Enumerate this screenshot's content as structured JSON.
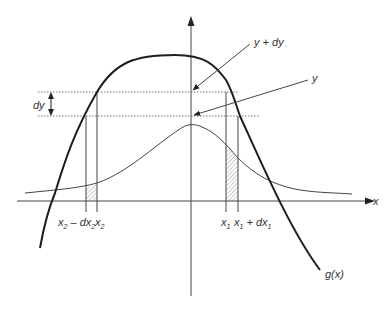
{
  "diagram": {
    "title": "",
    "colors": {
      "background": "#ffffff",
      "stroke": "#222222",
      "thin_stroke": "#444444",
      "dotted": "#777777",
      "hatch": "#999999",
      "text": "#333333"
    },
    "labels": {
      "x_axis": "x",
      "function": "g(x)",
      "y_plus_dy": "y + dy",
      "y": "y",
      "dy": "dy",
      "x2_minus_dx2": "x",
      "x2_minus_dx2_sub": "2",
      "x2_minus_dx2_mid": " – dx",
      "x2_minus_dx2_sub2": "2",
      "x2": "x",
      "x2_sub": "2",
      "x1": "x",
      "x1_sub": "1",
      "x1_plus_dx1": "x",
      "x1_plus_dx1_sub": "1",
      "x1_plus_dx1_mid": " + dx",
      "x1_plus_dx1_sub2": "1"
    }
  }
}
